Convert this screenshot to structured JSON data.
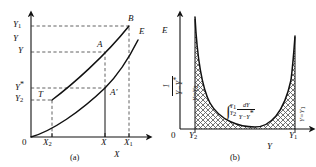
{
  "figure": {
    "kind": "two-panel-scientific-diagram",
    "line_color": "#111111",
    "dash_color": "#444444",
    "hatch_color": "#555555",
    "background": "#ffffff"
  },
  "panel_a": {
    "caption": "(a)",
    "x_axis_label": "X",
    "y_axis_label": "Y",
    "origin_label": "0",
    "x_ticks": [
      {
        "id": "X2",
        "base": "X",
        "sub": "2"
      },
      {
        "id": "X",
        "base": "X",
        "sub": ""
      },
      {
        "id": "X1",
        "base": "X",
        "sub": "1"
      }
    ],
    "y_ticks": [
      {
        "id": "Y1",
        "base": "Y",
        "sub": "1",
        "star": false
      },
      {
        "id": "Y",
        "base": "Y",
        "sub": "",
        "star": false
      },
      {
        "id": "Ystar",
        "base": "Y",
        "sub": "",
        "star": true
      },
      {
        "id": "Y2",
        "base": "Y",
        "sub": "2",
        "star": false
      }
    ],
    "points": [
      {
        "id": "B",
        "label": "B"
      },
      {
        "id": "A",
        "label": "A"
      },
      {
        "id": "Aprime",
        "label": "A′"
      },
      {
        "id": "T",
        "label": "T"
      }
    ],
    "curves": [
      {
        "id": "operating-line",
        "label": ""
      },
      {
        "id": "equilibrium-curve",
        "label": "E"
      }
    ]
  },
  "panel_b": {
    "caption": "(b)",
    "x_axis_label": "Y",
    "y_axis_label": "E",
    "origin_label": "0",
    "y_axis_expression": {
      "numerator": "1",
      "denominator": "Y − Y*"
    },
    "x_ticks": [
      {
        "id": "Y2",
        "base": "Y",
        "sub": "2"
      },
      {
        "id": "Y1",
        "base": "Y",
        "sub": "1"
      }
    ],
    "boundary_labels": [
      {
        "id": "left-boundary",
        "text": "Y=Y",
        "sub": "2"
      },
      {
        "id": "right-boundary",
        "text": "Y=Y",
        "sub": "1"
      }
    ],
    "area_expression": {
      "integral_sign": "∫",
      "upper_limit": {
        "base": "Y",
        "sub": "1"
      },
      "lower_limit": {
        "base": "Y",
        "sub": "2"
      },
      "numerator": "dY",
      "denominator": "Y − Y*"
    },
    "curve": {
      "id": "reciprocal-driving-force-curve",
      "shape": "u-shaped"
    },
    "shading": "cross-hatch"
  }
}
